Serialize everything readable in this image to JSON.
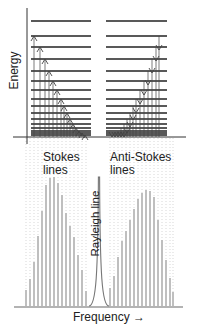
{
  "labels": {
    "energy": "Energy",
    "stokes_line1": "Stokes",
    "stokes_line2": "lines",
    "anti_stokes_line1": "Anti-Stokes",
    "anti_stokes_line2": "lines",
    "rayleigh": "Rayleigh line",
    "frequency": "Frequency →"
  },
  "colors": {
    "level_line": "#222222",
    "arrow": "#444444",
    "spectrum_line": "#8a8a8a",
    "dotted_guide": "#bdbdbd",
    "text": "#222222"
  },
  "energy_levels_y": [
    21,
    36,
    47,
    59,
    71,
    81,
    90,
    99,
    106,
    113,
    119,
    124,
    128,
    131,
    133,
    135
  ],
  "ground_y": 137,
  "stokes_arrows": [
    {
      "x": 34,
      "to_y": 36
    },
    {
      "x": 40,
      "to_y": 47
    },
    {
      "x": 45,
      "to_y": 59
    },
    {
      "x": 49,
      "to_y": 71
    },
    {
      "x": 53,
      "to_y": 81
    },
    {
      "x": 57,
      "to_y": 90
    },
    {
      "x": 61,
      "to_y": 99
    },
    {
      "x": 64,
      "to_y": 106
    },
    {
      "x": 67,
      "to_y": 113
    },
    {
      "x": 70,
      "to_y": 119
    },
    {
      "x": 73,
      "to_y": 124
    },
    {
      "x": 76,
      "to_y": 128
    },
    {
      "x": 79,
      "to_y": 131
    },
    {
      "x": 82,
      "to_y": 133
    },
    {
      "x": 85,
      "to_y": 135
    }
  ],
  "anti_stokes_arrows": [
    {
      "x": 159,
      "from_y": 36
    },
    {
      "x": 156,
      "from_y": 47
    },
    {
      "x": 152,
      "from_y": 59
    },
    {
      "x": 148,
      "from_y": 71
    },
    {
      "x": 144,
      "from_y": 81
    },
    {
      "x": 140,
      "from_y": 90
    },
    {
      "x": 136,
      "from_y": 99
    },
    {
      "x": 133,
      "from_y": 106
    },
    {
      "x": 130,
      "from_y": 113
    },
    {
      "x": 127,
      "from_y": 119
    },
    {
      "x": 124,
      "from_y": 124
    },
    {
      "x": 121,
      "from_y": 128
    },
    {
      "x": 118,
      "from_y": 131
    },
    {
      "x": 115,
      "from_y": 133
    },
    {
      "x": 112,
      "from_y": 135
    }
  ],
  "spectrum": {
    "baseline_y": 306,
    "rayleigh": {
      "x": 99,
      "top_y": 177
    },
    "stokes_lines": [
      {
        "x": 26,
        "top_y": 290
      },
      {
        "x": 30,
        "top_y": 279
      },
      {
        "x": 34,
        "top_y": 262
      },
      {
        "x": 38,
        "top_y": 236
      },
      {
        "x": 42,
        "top_y": 211
      },
      {
        "x": 46,
        "top_y": 185
      },
      {
        "x": 50,
        "top_y": 178
      },
      {
        "x": 54,
        "top_y": 177
      },
      {
        "x": 58,
        "top_y": 183
      },
      {
        "x": 62,
        "top_y": 195
      },
      {
        "x": 66,
        "top_y": 213
      },
      {
        "x": 70,
        "top_y": 226
      },
      {
        "x": 74,
        "top_y": 237
      },
      {
        "x": 78,
        "top_y": 255
      },
      {
        "x": 82,
        "top_y": 270
      },
      {
        "x": 86,
        "top_y": 291
      }
    ],
    "anti_stokes_lines": [
      {
        "x": 110,
        "top_y": 288
      },
      {
        "x": 114,
        "top_y": 276
      },
      {
        "x": 118,
        "top_y": 257
      },
      {
        "x": 122,
        "top_y": 241
      },
      {
        "x": 126,
        "top_y": 231
      },
      {
        "x": 130,
        "top_y": 220
      },
      {
        "x": 134,
        "top_y": 209
      },
      {
        "x": 138,
        "top_y": 199
      },
      {
        "x": 142,
        "top_y": 193
      },
      {
        "x": 146,
        "top_y": 190
      },
      {
        "x": 150,
        "top_y": 191
      },
      {
        "x": 154,
        "top_y": 197
      },
      {
        "x": 158,
        "top_y": 220
      },
      {
        "x": 162,
        "top_y": 240
      },
      {
        "x": 166,
        "top_y": 260
      },
      {
        "x": 170,
        "top_y": 278
      },
      {
        "x": 173,
        "top_y": 292
      }
    ]
  }
}
